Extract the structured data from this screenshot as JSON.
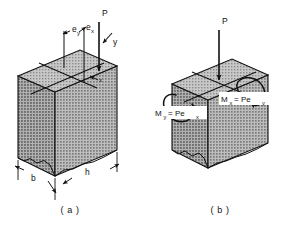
{
  "figure": {
    "background_color": "#ffffff",
    "line_color": "#111111",
    "block_face_colors": {
      "top": "#b6b6b6",
      "front": "#a8a8a8",
      "side": "#9a9a9a"
    }
  },
  "panel_a": {
    "caption": "( a )",
    "labels": {
      "load": "P",
      "ecc_x_base": "e",
      "ecc_x_sub": "x",
      "ecc_y_base": "e",
      "ecc_y_sub": "y",
      "axis_x": "x",
      "axis_y": "y",
      "dim_width": "b",
      "dim_depth": "h"
    }
  },
  "panel_b": {
    "caption": "( b )",
    "labels": {
      "load": "P",
      "moment_y_base": "M",
      "moment_y_sub": "y",
      "moment_y_eq": "= Pe",
      "moment_y_eq_sub": "x",
      "moment_x_base": "M",
      "moment_x_sub": "x",
      "moment_x_eq": "= Pe",
      "moment_x_eq_sub": "y"
    }
  }
}
